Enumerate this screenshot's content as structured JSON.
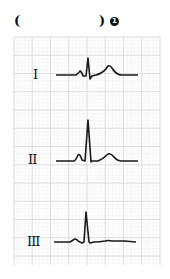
{
  "header": {
    "paren_open": "(",
    "paren_close": ")",
    "item_number": "1"
  },
  "grid": {
    "x0": 14,
    "y0": 37,
    "x1": 160,
    "y1": 265,
    "major": 18.25,
    "minor": 3.65,
    "major_color": "#d8d8d8",
    "minor_color": "#eeeeee"
  },
  "leads": [
    {
      "label": "I",
      "label_x": 33,
      "label_y": 67,
      "path": "M56,75 L76,75 Q79,73 80,71 Q82,72 83,76 L86,76 L88,58 L90,79 L92,76 L96,75 Q104,73 108,66 Q110,65 112,68 Q116,75 122,75 L138,75"
    },
    {
      "label": "II",
      "label_x": 28,
      "label_y": 152,
      "path": "M56,161 L74,161 Q76,160 78,155 Q80,153 82,160 L85,161 L88,120 L91,162 L92,161 L98,161 Q103,159 108,154 Q111,153 114,157 Q117,161 122,161 L138,161"
    },
    {
      "label": "III",
      "label_x": 27,
      "label_y": 234,
      "path": "M54,242 L70,242 Q73,240 75,239 Q77,239 78,241 L82,243 L84,242 L86,212 L89,242 L90,243 L94,242 Q100,242 105,241 Q108,240 112,241 L124,241 L136,242"
    }
  ],
  "colors": {
    "trace": "#1a1a1a",
    "text": "#111111"
  }
}
